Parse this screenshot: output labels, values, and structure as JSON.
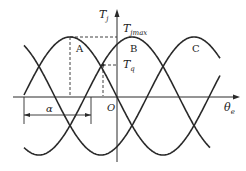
{
  "diagram": {
    "axes": {
      "y_label": "T",
      "y_label_sub": "j",
      "x_label": "θ",
      "x_label_sub": "e",
      "origin_label": "O"
    },
    "annotations": {
      "tjmax_label": "T",
      "tjmax_sub": "jmax",
      "tq_label": "T",
      "tq_sub": "q",
      "alpha_label": "α"
    },
    "curves": [
      {
        "name": "A",
        "label": "A"
      },
      {
        "name": "B",
        "label": "B"
      },
      {
        "name": "C",
        "label": "C"
      }
    ],
    "colors": {
      "stroke": "#2a2a2a",
      "text": "#222222"
    }
  }
}
